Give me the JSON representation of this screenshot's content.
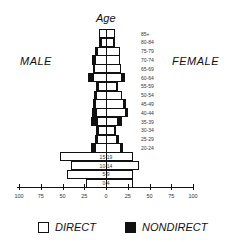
{
  "chart_data": {
    "type": "bar",
    "subtype": "population-pyramid-stacked",
    "title": "Age",
    "left_label": "MALE",
    "right_label": "FEMALE",
    "xlabel": "",
    "ylabel": "Age",
    "xlim": [
      -100,
      100
    ],
    "x_ticks": [
      "100",
      "75",
      "50",
      "25",
      "0",
      "25",
      "50",
      "75",
      "100"
    ],
    "legend": [
      {
        "name": "DIRECT",
        "color": "#ffffff"
      },
      {
        "name": "NONDIRECT",
        "color": "#111111"
      }
    ],
    "legend_position": "bottom",
    "categories": [
      "85+",
      "80-84",
      "75-79",
      "70-74",
      "65-69",
      "60-64",
      "55-59",
      "50-54",
      "45-49",
      "40-44",
      "35-39",
      "30-34",
      "25-29",
      "20-24",
      "15-19",
      "10-14",
      "5-9",
      "0-4"
    ],
    "series": [
      {
        "name": "Male DIRECT",
        "values": [
          8,
          6,
          10,
          13,
          14,
          15,
          9,
          11,
          13,
          11,
          10,
          9,
          10,
          13,
          53,
          40,
          45,
          23
        ]
      },
      {
        "name": "Male NONDIRECT",
        "values": [
          0,
          2,
          3,
          3,
          1,
          6,
          3,
          3,
          2,
          5,
          7,
          3,
          3,
          4,
          0,
          0,
          0,
          0
        ]
      },
      {
        "name": "Female DIRECT",
        "values": [
          10,
          9,
          16,
          16,
          17,
          18,
          13,
          18,
          21,
          23,
          14,
          10,
          13,
          17,
          31,
          38,
          31,
          31
        ]
      },
      {
        "name": "Female NONDIRECT",
        "values": [
          0,
          3,
          0,
          0,
          0,
          5,
          2,
          2,
          3,
          3,
          5,
          3,
          3,
          4,
          0,
          0,
          0,
          0
        ]
      }
    ],
    "inbar_labels": [
      "15-19",
      "10-14",
      "5-9",
      "0-4"
    ]
  },
  "title": "Age",
  "labels": {
    "male": "MALE",
    "female": "FEMALE"
  },
  "legend": {
    "direct": "DIRECT",
    "nondirect": "NONDIRECT"
  }
}
